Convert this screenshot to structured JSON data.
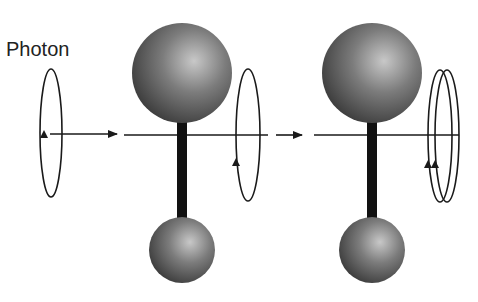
{
  "labels": {
    "photon": "Photon"
  },
  "colors": {
    "line": "#1a1a1a",
    "sphere_light": "#bdbdbd",
    "sphere_mid": "#7a7a7a",
    "sphere_dark": "#3a3a3a",
    "bond": "#111111"
  },
  "stages": [
    {
      "name": "incoming-photon",
      "loops": 1
    },
    {
      "name": "molecule-1",
      "loops_after": 1
    },
    {
      "name": "molecule-2",
      "loops_after": 2
    }
  ]
}
